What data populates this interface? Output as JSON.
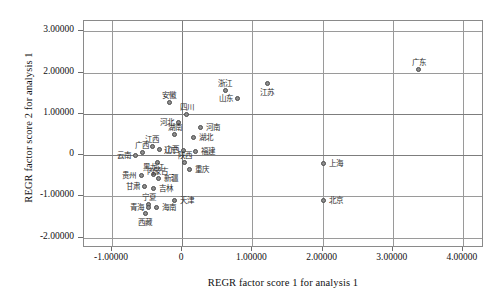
{
  "chart_data": {
    "type": "scatter",
    "title": "",
    "xlabel": "REGR factor score 1 for analysis 1",
    "ylabel": "REGR factor score 2 for analysis 1",
    "xlim": [
      -1.4,
      4.3
    ],
    "ylim": [
      -2.25,
      3.25
    ],
    "xticks": [
      "-1.00000",
      "0",
      "1.00000",
      "2.00000",
      "3.00000",
      "4.00000"
    ],
    "xtick_values": [
      -1,
      0,
      1,
      2,
      3,
      4
    ],
    "yticks": [
      "3.00000",
      "2.00000",
      "1.00000",
      "0",
      "-1.00000",
      "-2.00000"
    ],
    "ytick_values": [
      3,
      2,
      1,
      0,
      -1,
      -2
    ],
    "grid": true,
    "legend": "none",
    "marker": "open-circle-gray",
    "points": [
      {
        "label": "广东",
        "x": 3.38,
        "y": 2.06,
        "label_pos": "above"
      },
      {
        "label": "江苏",
        "x": 1.22,
        "y": 1.72,
        "label_pos": "below"
      },
      {
        "label": "浙江",
        "x": 0.62,
        "y": 1.55,
        "label_pos": "above"
      },
      {
        "label": "山东",
        "x": 0.8,
        "y": 1.35,
        "label_pos": "left"
      },
      {
        "label": "安徽",
        "x": -0.18,
        "y": 1.27,
        "label_pos": "above"
      },
      {
        "label": "四川",
        "x": 0.07,
        "y": 0.98,
        "label_pos": "above"
      },
      {
        "label": "河北",
        "x": -0.05,
        "y": 0.78,
        "label_pos": "left"
      },
      {
        "label": "河南",
        "x": 0.26,
        "y": 0.66,
        "label_pos": "right"
      },
      {
        "label": "湖南",
        "x": -0.1,
        "y": 0.48,
        "label_pos": "above"
      },
      {
        "label": "湖北",
        "x": 0.16,
        "y": 0.42,
        "label_pos": "right"
      },
      {
        "label": "江西",
        "x": -0.42,
        "y": 0.2,
        "label_pos": "above"
      },
      {
        "label": "山西",
        "x": -0.32,
        "y": 0.13,
        "label_pos": "right"
      },
      {
        "label": "辽宁",
        "x": 0.02,
        "y": 0.1,
        "label_pos": "left"
      },
      {
        "label": "福建",
        "x": 0.19,
        "y": 0.08,
        "label_pos": "right"
      },
      {
        "label": "广西",
        "x": -0.56,
        "y": 0.06,
        "label_pos": "above"
      },
      {
        "label": "云南",
        "x": -0.66,
        "y": -0.02,
        "label_pos": "left"
      },
      {
        "label": "内蒙古",
        "x": -0.34,
        "y": -0.18,
        "label_pos": "below"
      },
      {
        "label": "陕西",
        "x": 0.04,
        "y": -0.2,
        "label_pos": "above"
      },
      {
        "label": "重庆",
        "x": 0.11,
        "y": -0.36,
        "label_pos": "right"
      },
      {
        "label": "黑龙江",
        "x": -0.4,
        "y": -0.47,
        "label_pos": "above"
      },
      {
        "label": "贵州",
        "x": -0.58,
        "y": -0.5,
        "label_pos": "left"
      },
      {
        "label": "新疆",
        "x": -0.33,
        "y": -0.58,
        "label_pos": "right"
      },
      {
        "label": "甘肃",
        "x": -0.53,
        "y": -0.78,
        "label_pos": "left"
      },
      {
        "label": "吉林",
        "x": -0.4,
        "y": -0.82,
        "label_pos": "right"
      },
      {
        "label": "上海",
        "x": 2.02,
        "y": -0.22,
        "label_pos": "right"
      },
      {
        "label": "北京",
        "x": 2.02,
        "y": -1.1,
        "label_pos": "right"
      },
      {
        "label": "天津",
        "x": -0.1,
        "y": -1.12,
        "label_pos": "right"
      },
      {
        "label": "宁夏",
        "x": -0.47,
        "y": -1.2,
        "label_pos": "above"
      },
      {
        "label": "青海",
        "x": -0.47,
        "y": -1.27,
        "label_pos": "left"
      },
      {
        "label": "海南",
        "x": -0.36,
        "y": -1.27,
        "label_pos": "right"
      },
      {
        "label": "西藏",
        "x": -0.52,
        "y": -1.42,
        "label_pos": "below"
      }
    ]
  }
}
